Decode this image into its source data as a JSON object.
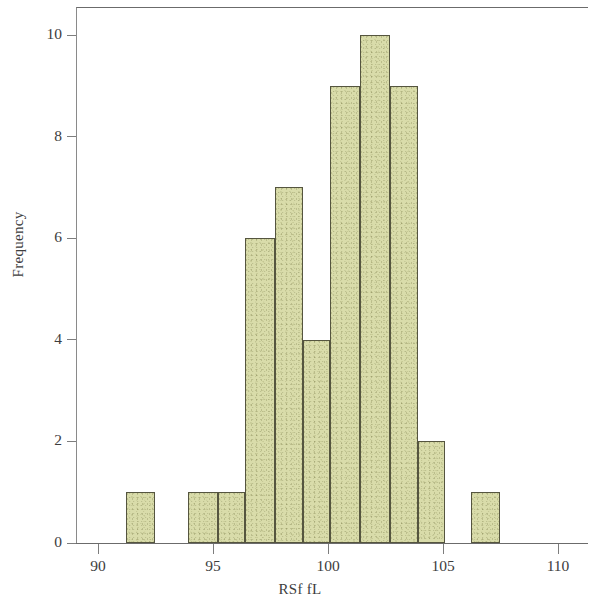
{
  "chart_data": {
    "type": "bar",
    "title": "",
    "subtitle": "",
    "xlabel": "RSf fL",
    "ylabel": "Frequency",
    "xlim": [
      88.8,
      111.1
    ],
    "ylim": [
      0,
      10.55
    ],
    "grid": false,
    "legend": null,
    "x_ticks": [
      90,
      95,
      100,
      105,
      110
    ],
    "x_tick_labels": [
      "90",
      "95",
      "100",
      "105",
      "110"
    ],
    "y_ticks": [
      0,
      2,
      4,
      6,
      8,
      10
    ],
    "y_tick_labels": [
      "0",
      "2",
      "4",
      "6",
      "8",
      "10"
    ],
    "bin_width": 1.27,
    "bar_fill_color": "#d9dcaa",
    "bar_edge_color": "#55553f",
    "axis_color": "#6b6b6b",
    "text_color": "#3d3d3d",
    "background_color": "#ffffff",
    "bins": [
      {
        "label": "91.2-92.5",
        "left": 91.2,
        "right": 92.5,
        "value": 1
      },
      {
        "label": "93.9-95.2",
        "left": 93.9,
        "right": 95.2,
        "value": 1
      },
      {
        "label": "95.2-96.4",
        "left": 95.2,
        "right": 96.4,
        "value": 1
      },
      {
        "label": "96.4-97.7",
        "left": 96.4,
        "right": 97.7,
        "value": 6
      },
      {
        "label": "97.7-98.9",
        "left": 97.7,
        "right": 98.9,
        "value": 7
      },
      {
        "label": "98.9-100.1",
        "left": 98.9,
        "right": 100.1,
        "value": 4
      },
      {
        "label": "100.1-101.4",
        "left": 100.1,
        "right": 101.4,
        "value": 9
      },
      {
        "label": "101.4-102.7",
        "left": 101.4,
        "right": 102.7,
        "value": 10
      },
      {
        "label": "102.7-103.9",
        "left": 102.7,
        "right": 103.9,
        "value": 9
      },
      {
        "label": "103.9-105.1",
        "left": 103.9,
        "right": 105.1,
        "value": 2
      },
      {
        "label": "106.2-107.5",
        "left": 106.2,
        "right": 107.5,
        "value": 1
      }
    ],
    "categories": [
      "91.2-92.5",
      "93.9-95.2",
      "95.2-96.4",
      "96.4-97.7",
      "97.7-98.9",
      "98.9-100.1",
      "100.1-101.4",
      "101.4-102.7",
      "102.7-103.9",
      "103.9-105.1",
      "106.2-107.5"
    ],
    "values": [
      1,
      1,
      1,
      6,
      7,
      4,
      9,
      10,
      9,
      2,
      1
    ],
    "total_count": 51
  }
}
